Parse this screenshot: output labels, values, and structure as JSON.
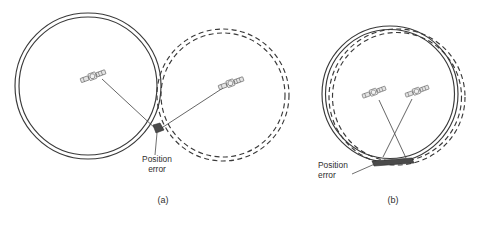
{
  "figure": {
    "background_color": "#ffffff",
    "line_color": "#3a3a3a",
    "error_patch_color": "#4a4a4a",
    "panels": [
      {
        "id": "panel-a",
        "caption": "(a)",
        "position_error_label_line1": "Position",
        "position_error_label_line2": "error",
        "satellites": [
          {
            "name": "satellite-a-left"
          },
          {
            "name": "satellite-a-right"
          }
        ],
        "range_bands": [
          {
            "name": "solid-range-band-a",
            "style": "solid"
          },
          {
            "name": "dashed-range-band-a",
            "style": "dashed"
          }
        ]
      },
      {
        "id": "panel-b",
        "caption": "(b)",
        "position_error_label_line1": "Position",
        "position_error_label_line2": "error",
        "satellites": [
          {
            "name": "satellite-b-left"
          },
          {
            "name": "satellite-b-right"
          }
        ],
        "range_bands": [
          {
            "name": "solid-range-band-b",
            "style": "solid"
          },
          {
            "name": "dashed-range-band-b",
            "style": "dashed"
          }
        ]
      }
    ]
  }
}
